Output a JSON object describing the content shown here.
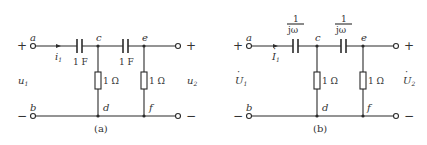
{
  "diagrams": [
    {
      "id": "a",
      "caption": "(a)",
      "plus_label": "+",
      "minus_label": "−",
      "input_voltage": {
        "symbol": "u",
        "sub": "1"
      },
      "output_voltage": {
        "symbol": "u",
        "sub": "2"
      },
      "current": {
        "symbol": "i",
        "sub": "1"
      },
      "nodes": {
        "a": "a",
        "b": "b",
        "c": "c",
        "d": "d",
        "e": "e",
        "f": "f"
      },
      "capacitors": [
        "1 F",
        "1 F"
      ],
      "resistors": [
        "1 Ω",
        "1 Ω"
      ]
    },
    {
      "id": "b",
      "caption": "(b)",
      "plus_label": "+",
      "minus_label": "−",
      "input_voltage": {
        "symbol": "U",
        "sub": "1",
        "phasor_dot": "·"
      },
      "output_voltage": {
        "symbol": "U",
        "sub": "2",
        "phasor_dot": "·"
      },
      "current": {
        "symbol": "I",
        "sub": "1",
        "phasor_dot": "·"
      },
      "nodes": {
        "a": "a",
        "b": "b",
        "c": "c",
        "d": "d",
        "e": "e",
        "f": "f"
      },
      "capacitors": [
        {
          "numerator": "1",
          "denominator": "jω"
        },
        {
          "numerator": "1",
          "denominator": "jω"
        }
      ],
      "resistors": [
        "1 Ω",
        "1 Ω"
      ]
    }
  ]
}
